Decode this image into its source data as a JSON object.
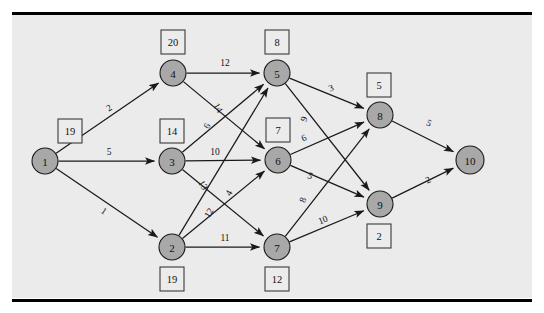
{
  "figure": {
    "background_color": "#ebebeb",
    "page_color": "#ffffff",
    "node_fill": "#a8a8a8",
    "node_stroke": "#1a1a1a",
    "box_fill": "#ececec",
    "box_stroke": "#3a3a3a",
    "edge_color": "#1a1a1a"
  },
  "chart_data": {
    "type": "diagram",
    "subtype": "directed-graph",
    "xlabel": "",
    "ylabel": "",
    "nodes": [
      {
        "id": "1",
        "label": "1",
        "x": 45,
        "y": 161,
        "box_value": "19",
        "box_x": 70,
        "box_y": 131
      },
      {
        "id": "2",
        "label": "2",
        "x": 172,
        "y": 247,
        "box_value": "19",
        "box_x": 172,
        "box_y": 279
      },
      {
        "id": "3",
        "label": "3",
        "x": 172,
        "y": 161,
        "box_value": "14",
        "box_x": 172,
        "box_y": 131
      },
      {
        "id": "4",
        "label": "4",
        "x": 173,
        "y": 73,
        "box_value": "20",
        "box_x": 173,
        "box_y": 42
      },
      {
        "id": "5",
        "label": "5",
        "x": 277,
        "y": 73,
        "box_value": "8",
        "box_x": 277,
        "box_y": 42
      },
      {
        "id": "6",
        "label": "6",
        "x": 278,
        "y": 160,
        "box_value": "7",
        "box_x": 278,
        "box_y": 130
      },
      {
        "id": "7",
        "label": "7",
        "x": 277,
        "y": 247,
        "box_value": "12",
        "box_x": 277,
        "box_y": 279
      },
      {
        "id": "8",
        "label": "8",
        "x": 380,
        "y": 115,
        "box_value": "5",
        "box_x": 379,
        "box_y": 85
      },
      {
        "id": "9",
        "label": "9",
        "x": 380,
        "y": 204,
        "box_value": "2",
        "box_x": 379,
        "box_y": 236
      },
      {
        "id": "10",
        "label": "10",
        "x": 470,
        "y": 160,
        "box_value": "",
        "box_x": 0,
        "box_y": 0
      }
    ],
    "node_radius": 13,
    "node_radius_large": 14,
    "box_size": 24,
    "edges": [
      {
        "from": "1",
        "to": "4",
        "weight": "2",
        "lx": 109,
        "ly": 108,
        "rot": -34
      },
      {
        "from": "1",
        "to": "3",
        "weight": "5",
        "lx": 109,
        "ly": 152,
        "rot": 0
      },
      {
        "from": "1",
        "to": "2",
        "weight": "1",
        "lx": 104,
        "ly": 211,
        "rot": 34
      },
      {
        "from": "4",
        "to": "5",
        "weight": "12",
        "lx": 225,
        "ly": 63,
        "rot": 0
      },
      {
        "from": "4",
        "to": "6",
        "weight": "14",
        "lx": 218,
        "ly": 108,
        "rot": 58
      },
      {
        "from": "3",
        "to": "5",
        "weight": "6",
        "lx": 207,
        "ly": 126,
        "rot": -60
      },
      {
        "from": "3",
        "to": "6",
        "weight": "10",
        "lx": 215,
        "ly": 152,
        "rot": 0
      },
      {
        "from": "3",
        "to": "7",
        "weight": "13",
        "lx": 203,
        "ly": 185,
        "rot": 60
      },
      {
        "from": "2",
        "to": "5",
        "weight": "4",
        "lx": 229,
        "ly": 193,
        "rot": -62
      },
      {
        "from": "2",
        "to": "6",
        "weight": "12",
        "lx": 209,
        "ly": 213,
        "rot": -60
      },
      {
        "from": "2",
        "to": "7",
        "weight": "11",
        "lx": 225,
        "ly": 238,
        "rot": 0
      },
      {
        "from": "5",
        "to": "8",
        "weight": "3",
        "lx": 331,
        "ly": 88,
        "rot": -22
      },
      {
        "from": "5",
        "to": "9",
        "weight": "9",
        "lx": 304,
        "ly": 119,
        "rot": -70
      },
      {
        "from": "6",
        "to": "8",
        "weight": "6",
        "lx": 304,
        "ly": 138,
        "rot": -24
      },
      {
        "from": "6",
        "to": "9",
        "weight": "5",
        "lx": 310,
        "ly": 176,
        "rot": 23
      },
      {
        "from": "7",
        "to": "8",
        "weight": "8",
        "lx": 303,
        "ly": 200,
        "rot": -70
      },
      {
        "from": "7",
        "to": "9",
        "weight": "10",
        "lx": 323,
        "ly": 220,
        "rot": -22
      },
      {
        "from": "8",
        "to": "10",
        "weight": "5",
        "lx": 429,
        "ly": 123,
        "rot": 26
      },
      {
        "from": "9",
        "to": "10",
        "weight": "2",
        "lx": 428,
        "ly": 180,
        "rot": -26
      }
    ],
    "node_box_values": {
      "1": "19",
      "2": "19",
      "3": "14",
      "4": "20",
      "5": "8",
      "6": "7",
      "7": "12",
      "8": "5",
      "9": "2"
    },
    "legend": [],
    "annotations": []
  },
  "frame": {
    "plate_x": 12,
    "plate_y": 14,
    "plate_w": 520,
    "plate_h": 284,
    "rule_top_y": 12,
    "rule_bottom_y": 299,
    "rule_x": 12,
    "rule_w": 520,
    "rule_h": 3
  }
}
